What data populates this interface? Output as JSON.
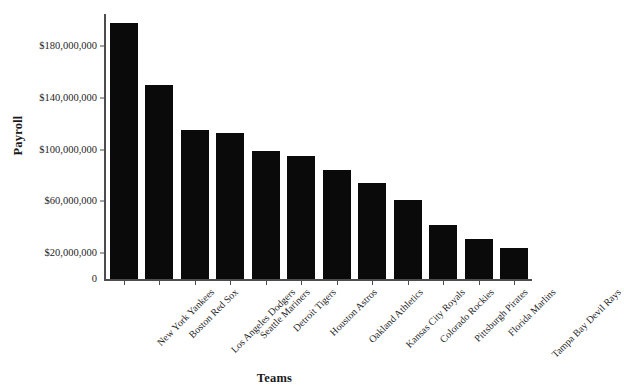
{
  "chart_data": {
    "type": "bar",
    "title": "",
    "xlabel": "Teams",
    "ylabel": "Payroll",
    "categories": [
      "New York Yankees",
      "Boston Red Sox",
      "Los Angeles Dodgers",
      "Seattle Mariners",
      "Detroit Tigers",
      "Houston Astros",
      "Oakland Athletics",
      "Kansas City Royals",
      "Colorado Rockies",
      "Pittsburgh Pirates",
      "Florida Marlins",
      "Tampa Bay Devil Rays"
    ],
    "values": [
      198000000,
      150000000,
      115000000,
      113000000,
      99000000,
      95000000,
      84000000,
      74000000,
      61000000,
      42000000,
      31000000,
      24000000
    ],
    "ytick_labels": [
      "$180,000,000",
      "$140,000,000",
      "$100,000,000",
      "$60,000,000",
      "$20,000,000",
      "0"
    ],
    "ytick_values": [
      180000000,
      140000000,
      100000000,
      60000000,
      20000000,
      0
    ],
    "ylim": [
      0,
      205000000
    ],
    "grid": false,
    "legend": false,
    "bar_color": "#0a0a0a",
    "axis_color": "#4d4d4d"
  }
}
